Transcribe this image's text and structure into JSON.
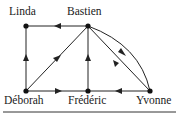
{
  "diagram": {
    "type": "directed-graph",
    "nodes": [
      {
        "id": "linda",
        "label": "Linda",
        "x": 26,
        "y": 26
      },
      {
        "id": "bastien",
        "label": "Bastien",
        "x": 88,
        "y": 26
      },
      {
        "id": "deborah",
        "label": "Déborah",
        "x": 26,
        "y": 91
      },
      {
        "id": "frederic",
        "label": "Frédéric",
        "x": 88,
        "y": 91
      },
      {
        "id": "yvonne",
        "label": "Yvonne",
        "x": 150,
        "y": 91
      }
    ],
    "edges": [
      {
        "from": "bastien",
        "to": "linda"
      },
      {
        "from": "deborah",
        "to": "linda"
      },
      {
        "from": "deborah",
        "to": "bastien"
      },
      {
        "from": "frederic",
        "to": "bastien"
      },
      {
        "from": "deborah",
        "to": "frederic"
      },
      {
        "from": "yvonne",
        "to": "frederic"
      },
      {
        "from": "bastien",
        "to": "yvonne",
        "curved": true
      },
      {
        "from": "yvonne",
        "to": "bastien"
      }
    ]
  }
}
